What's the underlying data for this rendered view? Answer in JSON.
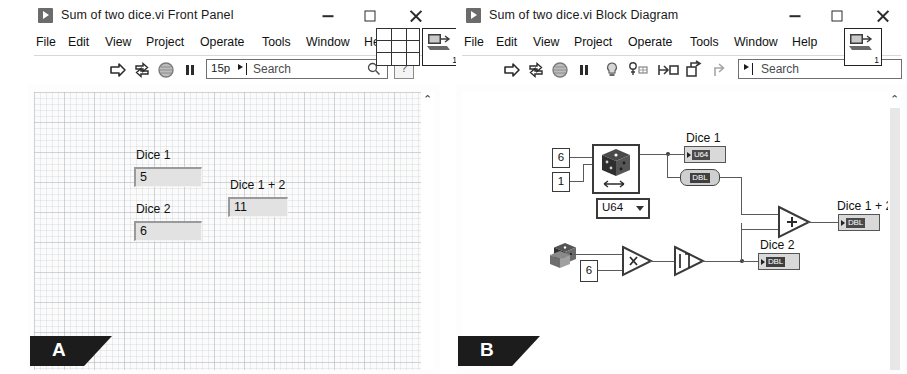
{
  "front_panel": {
    "title": "Sum of two dice.vi Front Panel",
    "app_icon": "labview-run-icon",
    "window_buttons": {
      "minimize": "Minimize",
      "maximize": "Maximize",
      "close": "Close"
    },
    "menu": [
      "File",
      "Edit",
      "View",
      "Project",
      "Operate",
      "Tools",
      "Window",
      "Help"
    ],
    "toolbar": {
      "icons": [
        "run-arrow-icon",
        "run-continuously-icon",
        "abort-execution-icon",
        "pause-icon"
      ],
      "font_size": "15p",
      "search_placeholder": "Search",
      "search_icon": "magnifier-icon",
      "context_help": "?"
    },
    "vi_icon_number": "1",
    "controls": [
      {
        "label": "Dice 1",
        "value": "5"
      },
      {
        "label": "Dice 2",
        "value": "6"
      },
      {
        "label": "Dice 1 + 2",
        "value": "11"
      }
    ],
    "scroll_up": "⌃",
    "flag": "A"
  },
  "block_diagram": {
    "title": "Sum of two dice.vi Block Diagram",
    "app_icon": "labview-run-icon",
    "window_buttons": {
      "minimize": "Minimize",
      "maximize": "Maximize",
      "close": "Close"
    },
    "menu": [
      "File",
      "Edit",
      "View",
      "Project",
      "Operate",
      "Tools",
      "Window",
      "Help"
    ],
    "toolbar": {
      "icons": [
        "run-arrow-icon",
        "run-continuously-icon",
        "abort-execution-icon",
        "pause-icon",
        "highlight-execution-icon",
        "retain-wire-values-icon",
        "step-into-icon",
        "step-over-icon",
        "step-out-icon"
      ],
      "search_placeholder": "Search",
      "search_prefix": "‣|"
    },
    "vi_icon_number": "1",
    "diagram": {
      "constants": {
        "range_high": "6",
        "range_low": "1",
        "multiplier": "6"
      },
      "representation_select": "U64",
      "nodes": {
        "dice_random": "random-number-range-icon",
        "random_01": "random-number-0-1-icon",
        "multiply": "x",
        "round_to_nearest": "round-to-nearest-icon",
        "add": "+"
      },
      "indicators": [
        {
          "label": "Dice 1",
          "type": "U64"
        },
        {
          "label": "Dice 2",
          "type": "DBL"
        },
        {
          "label": "Dice 1 + 2",
          "type": "DBL"
        }
      ],
      "coercion": {
        "type": "DBL"
      }
    },
    "scroll_up": "⌃",
    "flag": "B"
  }
}
